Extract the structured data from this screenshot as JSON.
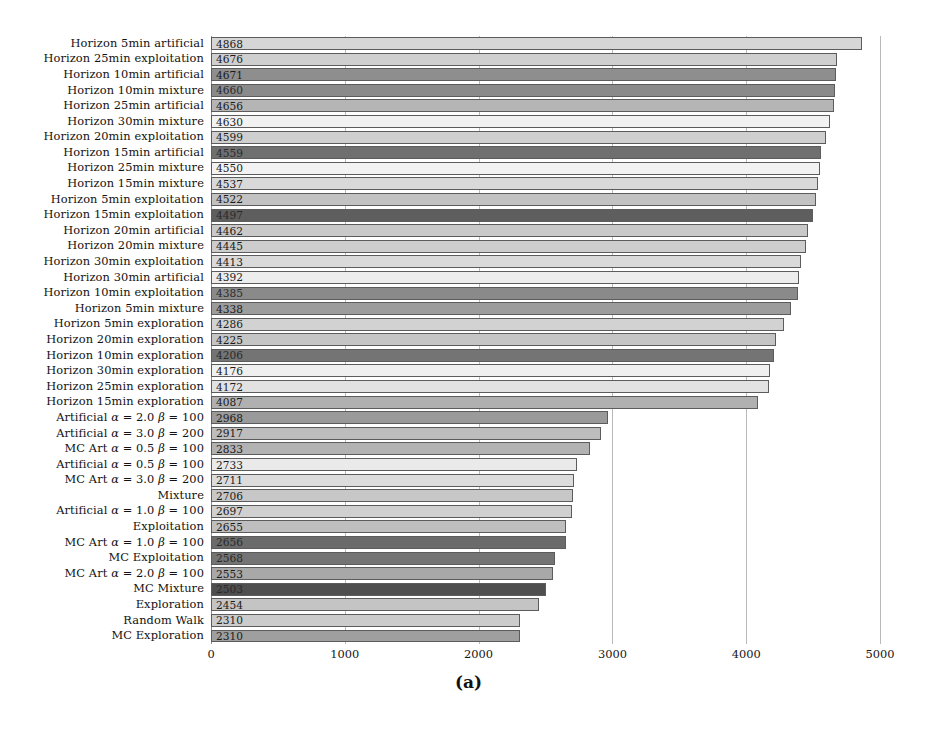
{
  "figure": {
    "caption": "(a)"
  },
  "chart_data": {
    "type": "bar",
    "orientation": "horizontal",
    "title": "",
    "xlabel": "",
    "ylabel": "",
    "xlim": [
      0,
      5000
    ],
    "xticks": [
      0,
      1000,
      2000,
      3000,
      4000,
      5000
    ],
    "xtick_labels": [
      "0",
      "1000",
      "2000",
      "3000",
      "4000",
      "5000"
    ],
    "grid": true,
    "legend": "none",
    "value_labels": true,
    "categories": [
      "Horizon 5min artificial",
      "Horizon 25min exploitation",
      "Horizon 10min artificial",
      "Horizon 10min mixture",
      "Horizon 25min artificial",
      "Horizon 30min mixture",
      "Horizon 20min exploitation",
      "Horizon 15min artificial",
      "Horizon 25min mixture",
      "Horizon 15min mixture",
      "Horizon 5min exploitation",
      "Horizon 15min exploitation",
      "Horizon 20min artificial",
      "Horizon 20min mixture",
      "Horizon 30min exploitation",
      "Horizon 30min artificial",
      "Horizon 10min exploitation",
      "Horizon 5min mixture",
      "Horizon 5min exploration",
      "Horizon 20min exploration",
      "Horizon 10min exploration",
      "Horizon 30min exploration",
      "Horizon 25min exploration",
      "Horizon 15min exploration",
      "Artificial α = 2.0 β = 100",
      "Artificial α = 3.0 β = 200",
      "MC Art α = 0.5 β = 100",
      "Artificial α = 0.5 β = 100",
      "MC Art α = 3.0 β = 200",
      "Mixture",
      "Artificial α = 1.0 β = 100",
      "Exploitation",
      "MC Art α = 1.0 β = 100",
      "MC Exploitation",
      "MC Art α = 2.0 β = 100",
      "MC Mixture",
      "Exploration",
      "Random Walk",
      "MC Exploration"
    ],
    "values": [
      4868,
      4676,
      4671,
      4660,
      4656,
      4630,
      4599,
      4559,
      4550,
      4537,
      4522,
      4497,
      4462,
      4445,
      4413,
      4392,
      4385,
      4338,
      4286,
      4225,
      4206,
      4176,
      4172,
      4087,
      2968,
      2917,
      2833,
      2733,
      2711,
      2706,
      2697,
      2655,
      2656,
      2568,
      2553,
      2503,
      2454,
      2310,
      2310
    ],
    "bar_colors": [
      "#d6d6d6",
      "#cfcfcf",
      "#8e8e8e",
      "#8a8a8a",
      "#b5b5b5",
      "#f2f2f2",
      "#cfcfcf",
      "#6f6f6f",
      "#f2f2f2",
      "#d9d9d9",
      "#c2c2c2",
      "#5e5e5e",
      "#c9c9c9",
      "#cdcdcd",
      "#dadada",
      "#ededed",
      "#8a8a8a",
      "#9c9c9c",
      "#d2d2d2",
      "#c5c5c5",
      "#747474",
      "#f0f0f0",
      "#e2e2e2",
      "#b0b0b0",
      "#9a9a9a",
      "#bdbdbd",
      "#b2b2b2",
      "#eaeaea",
      "#dcdcdc",
      "#c7c7c7",
      "#d0d0d0",
      "#bfbfbf",
      "#6b6b6b",
      "#747474",
      "#a8a8a8",
      "#4f4f4f",
      "#c4c4c4",
      "#cbcbcb",
      "#9f9f9f"
    ]
  }
}
